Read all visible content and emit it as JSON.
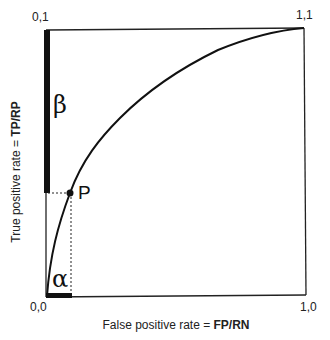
{
  "diagram": {
    "type": "ROC curve illustration",
    "corners": {
      "top_left": "0,1",
      "top_right": "1,1",
      "bottom_left": "0,0",
      "bottom_right": "1,0"
    },
    "y_axis": {
      "label_prefix": "True positive rate = ",
      "label_bold": "TP/RP"
    },
    "x_axis": {
      "label_prefix": "False positive rate = ",
      "label_bold": "FP/RN"
    },
    "point": {
      "label": "P"
    },
    "regions": {
      "beta": "β",
      "alpha": "α"
    },
    "colors": {
      "line": "#111111",
      "background": "#ffffff"
    }
  }
}
